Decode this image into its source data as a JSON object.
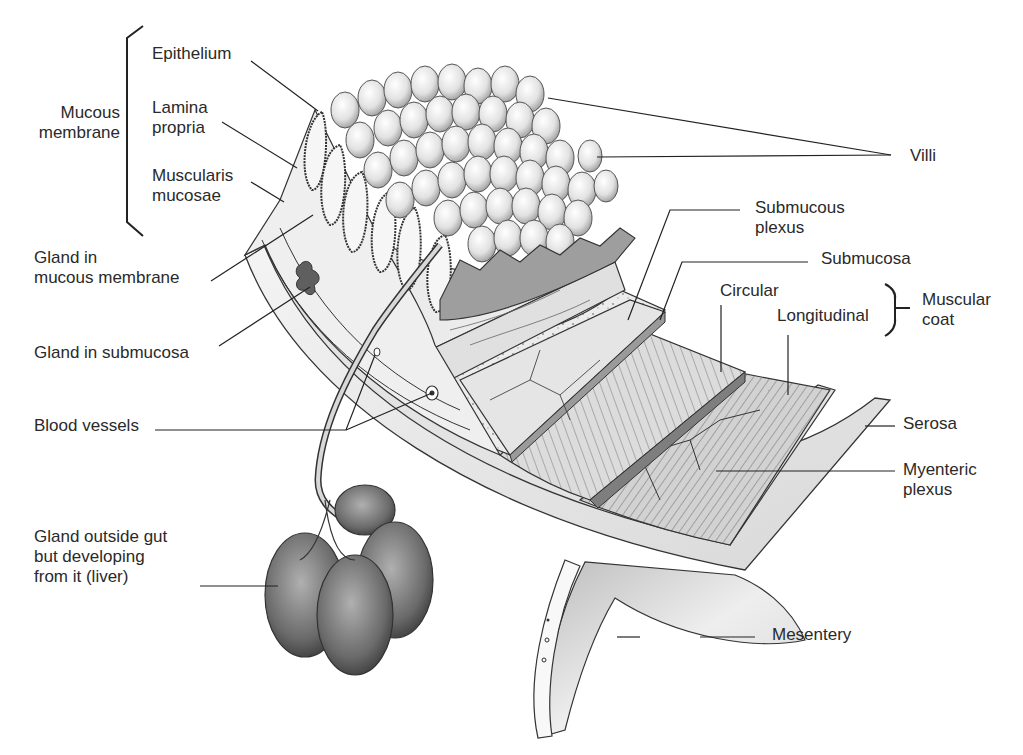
{
  "diagram": {
    "colors": {
      "ink": "#2a2a2a",
      "light_fill": "#eeeeee",
      "mid_fill": "#cfcfcf",
      "dark_fill": "#7a7a7a",
      "background": "#ffffff"
    },
    "labels": {
      "mucous_membrane": "Mucous\nmembrane",
      "epithelium": "Epithelium",
      "lamina_propria": "Lamina\npropria",
      "muscularis_mucosae": "Muscularis\nmucosae",
      "gland_mucous_membrane": "Gland in\nmucous membrane",
      "gland_submucosa": "Gland in submucosa",
      "blood_vessels": "Blood vessels",
      "gland_outside_gut": "Gland outside gut\nbut developing\nfrom it (liver)",
      "villi": "Villi",
      "submucous_plexus": "Submucous\nplexus",
      "submucosa": "Submucosa",
      "circular": "Circular",
      "longitudinal": "Longitudinal",
      "muscular_coat": "Muscular\ncoat",
      "serosa": "Serosa",
      "myenteric_plexus": "Myenteric\nplexus",
      "mesentery": "Mesentery"
    }
  }
}
